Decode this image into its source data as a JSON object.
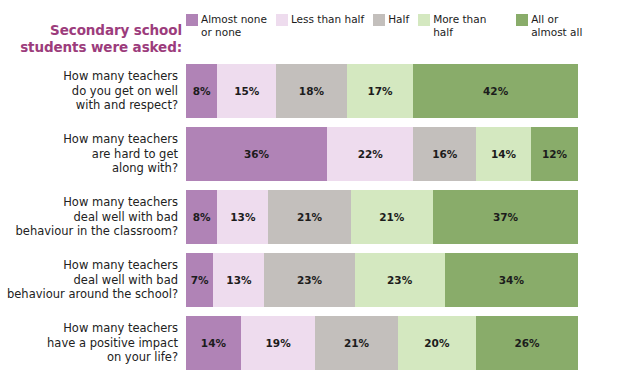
{
  "title": "Secondary school\nstudents were asked:",
  "title_color": "#9c3c7c",
  "legend": {
    "position": "top",
    "items": [
      {
        "label": "Almost none\nor none",
        "color": "#b083b6",
        "icon": "legend-swatch"
      },
      {
        "label": "Less than half",
        "color": "#eedcee",
        "icon": "legend-swatch"
      },
      {
        "label": "Half",
        "color": "#c3bfbc",
        "icon": "legend-swatch"
      },
      {
        "label": "More than half",
        "color": "#d4e8c0",
        "icon": "legend-swatch"
      },
      {
        "label": "All or\nalmost all",
        "color": "#89ac6a",
        "icon": "legend-swatch"
      }
    ]
  },
  "chart_data": {
    "type": "bar",
    "orientation": "horizontal",
    "stacked": true,
    "title": "Secondary school students were asked:",
    "xlabel": "",
    "ylabel": "",
    "xlim": [
      0,
      100
    ],
    "grid": false,
    "legend_position": "top",
    "unit": "%",
    "categories": [
      "How many teachers do you get on well with and respect?",
      "How many teachers are hard to get along with?",
      "How many teachers deal well with bad behaviour in the classroom?",
      "How many teachers deal well with bad behaviour around the school?",
      "How many teachers have a positive impact on your life?"
    ],
    "series": [
      {
        "name": "Almost none or none",
        "color": "#b083b6",
        "values": [
          8,
          36,
          8,
          7,
          14
        ]
      },
      {
        "name": "Less than half",
        "color": "#eedcee",
        "values": [
          15,
          22,
          13,
          13,
          19
        ]
      },
      {
        "name": "Half",
        "color": "#c3bfbc",
        "values": [
          18,
          16,
          21,
          23,
          21
        ]
      },
      {
        "name": "More than half",
        "color": "#d4e8c0",
        "values": [
          17,
          14,
          21,
          23,
          20
        ]
      },
      {
        "name": "All or almost all",
        "color": "#89ac6a",
        "values": [
          42,
          12,
          37,
          34,
          26
        ]
      }
    ]
  },
  "rows": [
    {
      "label": "How many teachers\ndo you get on well\nwith and respect?",
      "segments": [
        {
          "value": 8,
          "text": "8%",
          "color": "#b083b6"
        },
        {
          "value": 15,
          "text": "15%",
          "color": "#eedcee"
        },
        {
          "value": 18,
          "text": "18%",
          "color": "#c3bfbc"
        },
        {
          "value": 17,
          "text": "17%",
          "color": "#d4e8c0"
        },
        {
          "value": 42,
          "text": "42%",
          "color": "#89ac6a"
        }
      ]
    },
    {
      "label": "How many teachers\nare hard to get\nalong with?",
      "segments": [
        {
          "value": 36,
          "text": "36%",
          "color": "#b083b6"
        },
        {
          "value": 22,
          "text": "22%",
          "color": "#eedcee"
        },
        {
          "value": 16,
          "text": "16%",
          "color": "#c3bfbc"
        },
        {
          "value": 14,
          "text": "14%",
          "color": "#d4e8c0"
        },
        {
          "value": 12,
          "text": "12%",
          "color": "#89ac6a"
        }
      ]
    },
    {
      "label": "How many teachers\ndeal well with bad\nbehaviour in the classroom?",
      "segments": [
        {
          "value": 8,
          "text": "8%",
          "color": "#b083b6"
        },
        {
          "value": 13,
          "text": "13%",
          "color": "#eedcee"
        },
        {
          "value": 21,
          "text": "21%",
          "color": "#c3bfbc"
        },
        {
          "value": 21,
          "text": "21%",
          "color": "#d4e8c0"
        },
        {
          "value": 37,
          "text": "37%",
          "color": "#89ac6a"
        }
      ]
    },
    {
      "label": "How many teachers\ndeal well with bad\nbehaviour around the school?",
      "segments": [
        {
          "value": 7,
          "text": "7%",
          "color": "#b083b6"
        },
        {
          "value": 13,
          "text": "13%",
          "color": "#eedcee"
        },
        {
          "value": 23,
          "text": "23%",
          "color": "#c3bfbc"
        },
        {
          "value": 23,
          "text": "23%",
          "color": "#d4e8c0"
        },
        {
          "value": 34,
          "text": "34%",
          "color": "#89ac6a"
        }
      ]
    },
    {
      "label": "How many teachers\nhave a positive impact\non your life?",
      "segments": [
        {
          "value": 14,
          "text": "14%",
          "color": "#b083b6"
        },
        {
          "value": 19,
          "text": "19%",
          "color": "#eedcee"
        },
        {
          "value": 21,
          "text": "21%",
          "color": "#c3bfbc"
        },
        {
          "value": 20,
          "text": "20%",
          "color": "#d4e8c0"
        },
        {
          "value": 26,
          "text": "26%",
          "color": "#89ac6a"
        }
      ]
    }
  ]
}
